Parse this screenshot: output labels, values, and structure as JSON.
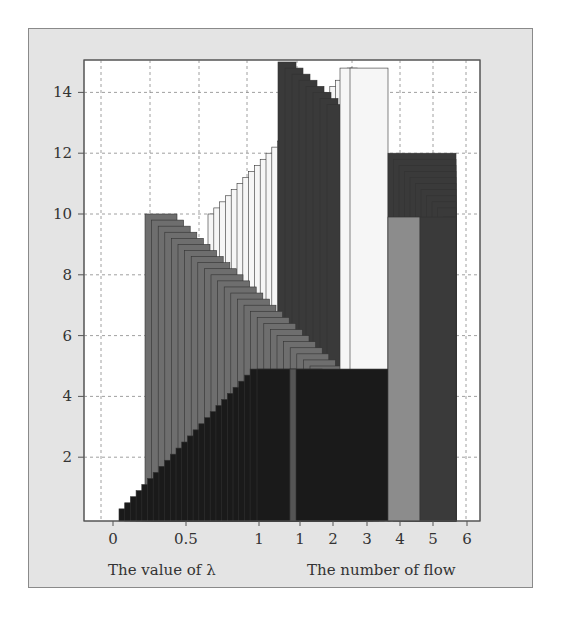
{
  "chart_data": {
    "type": "bar",
    "title": "",
    "ylabel": "",
    "ylim": [
      0,
      15
    ],
    "yticks": [
      2,
      4,
      6,
      8,
      10,
      12,
      14
    ],
    "grid": true,
    "panels": [
      {
        "xlabel": "The value of λ",
        "xticks": [
          "0",
          "0.5",
          "1"
        ],
        "series": [
          {
            "name": "black ascending",
            "color": "#1a1a1a",
            "values": [
              0.3,
              0.5,
              0.7,
              0.9,
              1.1,
              1.3,
              1.5,
              1.7,
              1.9,
              2.1,
              2.3,
              2.5,
              2.7,
              2.9,
              3.1,
              3.3,
              3.5,
              3.7,
              3.9,
              4.1,
              4.3,
              4.5,
              4.7,
              4.9
            ]
          },
          {
            "name": "gray descending",
            "color": "#6e6e6e",
            "values": [
              10.0,
              9.8,
              9.6,
              9.4,
              9.2,
              9.0,
              8.8,
              8.6,
              8.4,
              8.2,
              8.0,
              7.8,
              7.6,
              7.4,
              7.2,
              7.0,
              6.8,
              6.6,
              6.4,
              6.2,
              6.0,
              5.8,
              5.6,
              5.4,
              5.2,
              5.0
            ]
          },
          {
            "name": "white ascending",
            "color": "#f6f6f6",
            "values": [
              10.0,
              10.2,
              10.4,
              10.6,
              10.8,
              11.0,
              11.2,
              11.4,
              11.6,
              11.8,
              12.0,
              12.2,
              12.4,
              12.6,
              12.8,
              13.0,
              13.2,
              13.4,
              13.6,
              13.8,
              14.0,
              14.2,
              14.4,
              14.6,
              14.8
            ]
          },
          {
            "name": "dark descending (top)",
            "color": "#3a3a3a",
            "values": [
              15.0,
              14.8,
              14.6,
              14.4,
              14.2,
              14.0,
              13.8,
              13.6
            ]
          }
        ]
      },
      {
        "xlabel": "The number of flow",
        "xticks": [
          "1",
          "2",
          "3",
          "4",
          "5",
          "6"
        ],
        "series": [
          {
            "name": "dark",
            "color": "#1a1a1a",
            "values": [
              4.9
            ]
          },
          {
            "name": "gray",
            "color": "#6e6e6e",
            "values": [
              4.9,
              0,
              0,
              0,
              0
            ]
          },
          {
            "name": "light",
            "color": "#d8d8d8",
            "values": [
              0.9,
              0.6,
              0.3
            ]
          },
          {
            "name": "white",
            "color": "#f6f6f6",
            "values": [
              14.8,
              14.8
            ]
          },
          {
            "name": "medium gray",
            "color": "#8c8c8c",
            "values": [
              9.9
            ]
          },
          {
            "name": "dark (right)",
            "color": "#3a3a3a",
            "values": [
              12.0,
              11.8,
              11.6,
              11.4,
              11.2,
              11.0,
              10.8,
              10.6,
              10.4,
              10.2,
              9.9
            ]
          }
        ]
      }
    ]
  },
  "axes": {
    "y_tick_labels": [
      "2",
      "4",
      "6",
      "8",
      "10",
      "12",
      "14"
    ],
    "x_left_tick_labels": [
      "0",
      "0.5",
      "1"
    ],
    "x_right_tick_labels": [
      "1",
      "2",
      "3",
      "4",
      "5",
      "6"
    ],
    "x_left_title": "The value of λ",
    "x_right_title": "The number of flow"
  }
}
